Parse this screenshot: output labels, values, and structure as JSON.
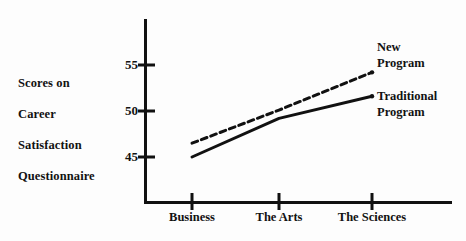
{
  "chart_data": {
    "type": "line",
    "title": "",
    "subtitle": "",
    "xlabel": "",
    "ylabel": "Scores on Career Satisfaction Questionnaire",
    "ylabel_lines": [
      "Scores on",
      "Career",
      "Satisfaction",
      "Questionnaire"
    ],
    "categories": [
      "Business",
      "The Arts",
      "The Sciences"
    ],
    "yticks": [
      45,
      50,
      55
    ],
    "ytick_labels": [
      "45",
      "50",
      "55"
    ],
    "ylim": [
      43,
      56
    ],
    "grid": false,
    "legend_position": "inline-right",
    "series": [
      {
        "name": "New Program",
        "name_lines": [
          "New",
          "Program"
        ],
        "style": "dashed",
        "color": "#111111",
        "values": [
          46.5,
          50.1,
          54.2
        ]
      },
      {
        "name": "Traditional Program",
        "name_lines": [
          "Traditional",
          "Program"
        ],
        "style": "solid",
        "color": "#111111",
        "values": [
          45.0,
          49.2,
          51.6
        ]
      }
    ]
  },
  "axes": {
    "y_axis_name": "vertical-axis",
    "x_axis_name": "horizontal-axis"
  },
  "colors": {
    "ink": "#111111",
    "background": "#fdfdfd"
  }
}
